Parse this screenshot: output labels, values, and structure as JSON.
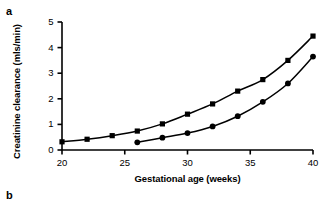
{
  "panels": {
    "a": "a",
    "b": "b"
  },
  "chart_data": {
    "type": "line",
    "title": "",
    "xlabel": "Gestational age (weeks)",
    "ylabel": "Creatinine clearance (mls/min)",
    "xlim": [
      20,
      40
    ],
    "ylim": [
      0,
      5
    ],
    "xticks": [
      20,
      25,
      30,
      35,
      40
    ],
    "yticks": [
      0,
      1,
      2,
      3,
      4,
      5
    ],
    "grid": false,
    "legend": "none",
    "color": "#000000",
    "series": [
      {
        "name": "upper-series",
        "marker": "square",
        "x": [
          20,
          22,
          24,
          26,
          28,
          30,
          32,
          34,
          36,
          38,
          40
        ],
        "values": [
          0.32,
          0.42,
          0.56,
          0.74,
          1.02,
          1.4,
          1.8,
          2.3,
          2.75,
          3.5,
          4.45
        ]
      },
      {
        "name": "lower-series",
        "marker": "circle",
        "x": [
          26,
          28,
          30,
          32,
          34,
          36,
          38,
          40
        ],
        "values": [
          0.3,
          0.48,
          0.66,
          0.92,
          1.32,
          1.88,
          2.6,
          3.65
        ]
      }
    ]
  }
}
